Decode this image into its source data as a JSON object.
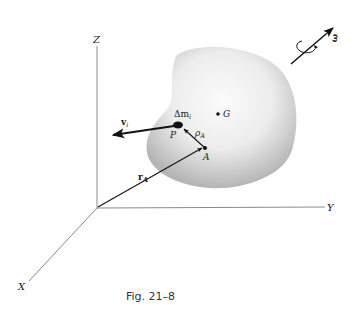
{
  "figure": {
    "caption": "Fig. 21–8",
    "axes": {
      "x_label": "X",
      "y_label": "Y",
      "z_label": "Z"
    },
    "points": {
      "mass_point_label": "P",
      "mass_element_label": "Δm",
      "mass_element_subscript": "i",
      "reference_point_label": "A",
      "center_of_mass_label": "G"
    },
    "vectors": {
      "velocity_label": "v",
      "velocity_subscript": "i",
      "position_A_label": "r",
      "position_A_subscript": "A",
      "relative_position_label": "ρ",
      "relative_position_subscript": "A",
      "angular_velocity_label": "ω"
    },
    "colors": {
      "body_fill_light": "#f7f7f7",
      "body_fill_dark": "#b9b9b9",
      "axis": "#888888",
      "vector": "#111111"
    }
  }
}
